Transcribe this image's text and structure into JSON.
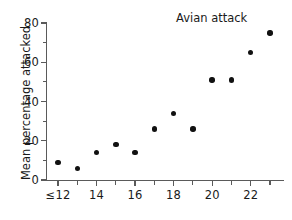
{
  "chart_data": {
    "type": "scatter",
    "title": "",
    "annotation": "Avian attack",
    "xlabel": "",
    "ylabel": "Mean percentage attacked",
    "xlim": [
      11.4,
      23.6
    ],
    "ylim": [
      0,
      84
    ],
    "grid": false,
    "legend": "none",
    "x_tick_labels": [
      "≤12",
      "14",
      "16",
      "18",
      "20",
      "22"
    ],
    "x_tick_values": [
      12,
      14,
      16,
      18,
      20,
      22
    ],
    "x_minor_tick_values": [
      13,
      15,
      17,
      19,
      21,
      23
    ],
    "y_tick_labels": [
      "0",
      "20",
      "40",
      "60",
      "80"
    ],
    "y_tick_values": [
      0,
      20,
      40,
      60,
      80
    ],
    "y_minor_tick_values": [
      10,
      30,
      50,
      70
    ],
    "x": [
      12,
      13,
      14,
      15,
      16,
      17,
      18,
      19,
      20,
      21,
      22,
      23
    ],
    "values": [
      9,
      6,
      14,
      18,
      14,
      26,
      34,
      26,
      51,
      51,
      65,
      75
    ],
    "marker": "filled-circle",
    "marker_color": "#111111"
  },
  "colors": {
    "background": "#ffffff",
    "axis": "#5a5a5a",
    "text": "#1a1a1a",
    "marker": "#111111"
  }
}
